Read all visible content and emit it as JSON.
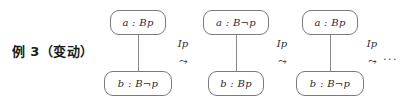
{
  "figure": {
    "caption": "例 3（变动）",
    "trailing_ellipsis": "...",
    "transition_arrow_glyph": "squiggly-arrow",
    "diagrams": [
      {
        "top_node": "a : Bp",
        "bottom_node": "b : B¬p"
      },
      {
        "top_node": "a : B¬p",
        "bottom_node": "b : Bp"
      },
      {
        "top_node": "a : Bp",
        "bottom_node": "b : B¬p"
      }
    ],
    "transitions": [
      {
        "label": "Ip",
        "arrow": "⤳"
      },
      {
        "label": "Ip",
        "arrow": "⤳"
      },
      {
        "label": "Ip",
        "arrow": "⤳"
      }
    ],
    "colors": {
      "node_border": "#7a7a7a",
      "edge": "#8a8a8a",
      "text": "#2a2a2a",
      "background": "#ffffff"
    }
  }
}
